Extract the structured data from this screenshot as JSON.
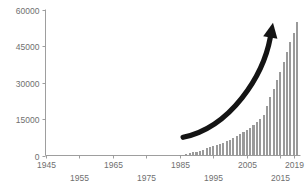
{
  "chart_data": {
    "type": "bar",
    "title": "",
    "xlabel": "",
    "ylabel": "",
    "xlim": [
      1945,
      2021
    ],
    "ylim": [
      0,
      60000
    ],
    "grid": false,
    "legend": null,
    "bar_color": "#9a9a9a",
    "axis_color": "#9e9e9e",
    "tick_label_color": "#6f6f6f",
    "annotation_color": "#141414",
    "ytick_labels": [
      "0",
      "15000",
      "30000",
      "45000",
      "60000"
    ],
    "ytick_values": [
      0,
      15000,
      30000,
      45000,
      60000
    ],
    "xtick_labels": [
      "1945",
      "1955",
      "1965",
      "1975",
      "1985",
      "1995",
      "2005",
      "2015",
      "2019"
    ],
    "xtick_values": [
      1945,
      1955,
      1965,
      1975,
      1985,
      1995,
      2005,
      2015,
      2019
    ],
    "xtick_label_rows": [
      0,
      1,
      0,
      1,
      0,
      1,
      0,
      1,
      0
    ],
    "annotations": [
      {
        "name": "growth-arrow",
        "kind": "curved-arrow",
        "from_year": 1986,
        "from_value": 7500,
        "to_year": 2012,
        "to_value": 48500
      }
    ],
    "x": [
      1945,
      1946,
      1947,
      1948,
      1949,
      1950,
      1951,
      1952,
      1953,
      1954,
      1955,
      1956,
      1957,
      1958,
      1959,
      1960,
      1961,
      1962,
      1963,
      1964,
      1965,
      1966,
      1967,
      1968,
      1969,
      1970,
      1971,
      1972,
      1973,
      1974,
      1975,
      1976,
      1977,
      1978,
      1979,
      1980,
      1981,
      1982,
      1983,
      1984,
      1985,
      1986,
      1987,
      1988,
      1989,
      1990,
      1991,
      1992,
      1993,
      1994,
      1995,
      1996,
      1997,
      1998,
      1999,
      2000,
      2001,
      2002,
      2003,
      2004,
      2005,
      2006,
      2007,
      2008,
      2009,
      2010,
      2011,
      2012,
      2013,
      2014,
      2015,
      2016,
      2017,
      2018,
      2019,
      2020
    ],
    "values": [
      0,
      0,
      0,
      0,
      0,
      0,
      0,
      0,
      0,
      0,
      0,
      0,
      0,
      0,
      0,
      0,
      0,
      0,
      0,
      0,
      120,
      0,
      0,
      0,
      0,
      0,
      0,
      0,
      0,
      0,
      0,
      0,
      0,
      0,
      0,
      0,
      0,
      0,
      0,
      0,
      150,
      350,
      600,
      900,
      1250,
      1600,
      2000,
      2450,
      2900,
      3350,
      3800,
      4300,
      4800,
      5300,
      5900,
      6500,
      7200,
      7900,
      8700,
      9600,
      10500,
      11500,
      12600,
      13800,
      15200,
      16800,
      20500,
      24000,
      27500,
      31000,
      34500,
      38500,
      42500,
      46500,
      50500,
      55000
    ]
  }
}
